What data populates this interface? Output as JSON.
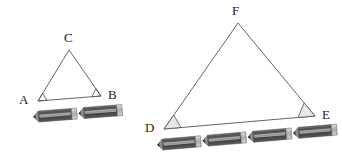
{
  "figure": {
    "background_color": "#ffffff",
    "stroke_color": "#555555",
    "angle_fill_color": "#e8e8e8",
    "pencil_body_color": "#5a5a5a",
    "pencil_stripe_color": "#a8a8a8",
    "pencil_tip_color": "#3a3a3a",
    "pencil_ferrule_color": "#cfcfcf"
  },
  "triangles": [
    {
      "id": "small-triangle",
      "name": "triangle-ABC",
      "vertices": [
        {
          "label": "A",
          "x": 38,
          "y": 101,
          "label_x": 19,
          "label_y": 104
        },
        {
          "label": "B",
          "x": 101,
          "y": 96,
          "label_x": 108,
          "label_y": 99
        },
        {
          "label": "C",
          "x": 69,
          "y": 50,
          "label_x": 64,
          "label_y": 42
        }
      ],
      "angle_markers": [
        {
          "at": "A",
          "filled": false
        },
        {
          "at": "B",
          "filled": false
        }
      ],
      "base_label": "AB",
      "pencil_count": 2
    },
    {
      "id": "large-triangle",
      "name": "triangle-DEF",
      "vertices": [
        {
          "label": "D",
          "x": 164,
          "y": 129,
          "label_x": 145,
          "label_y": 132
        },
        {
          "label": "E",
          "x": 315,
          "y": 116,
          "label_x": 322,
          "label_y": 119
        },
        {
          "label": "F",
          "x": 238,
          "y": 23,
          "label_x": 232,
          "label_y": 15
        }
      ],
      "angle_markers": [
        {
          "at": "D",
          "filled": true
        },
        {
          "at": "E",
          "filled": true
        }
      ],
      "base_label": "DE",
      "pencil_count": 4
    }
  ],
  "pencil_rows": [
    {
      "id": "pencil-row-ab",
      "name": "pencil-row-under-AB",
      "count": 2,
      "start_x": 33,
      "start_y": 117,
      "pencil_length": 44,
      "pencil_height": 11,
      "angle_deg": -4.5
    },
    {
      "id": "pencil-row-de",
      "name": "pencil-row-under-DE",
      "count": 4,
      "start_x": 157,
      "start_y": 145,
      "pencil_length": 44,
      "pencil_height": 11,
      "angle_deg": -4.9
    }
  ],
  "labels": {
    "A": "A",
    "B": "B",
    "C": "C",
    "D": "D",
    "E": "E",
    "F": "F"
  }
}
